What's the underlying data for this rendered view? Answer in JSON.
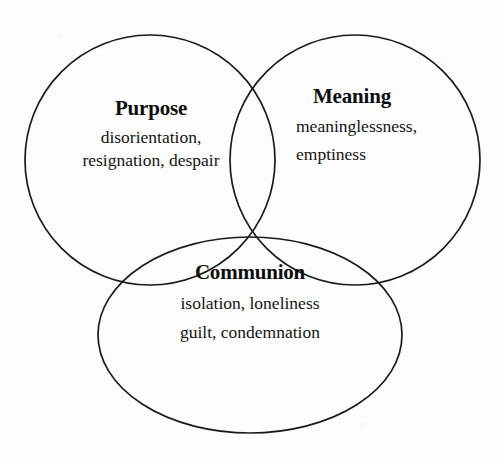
{
  "diagram": {
    "type": "venn",
    "set_count": 3,
    "background_color": "#fdfdfd",
    "stroke_color": "#1a1a1a",
    "text_color": "#111111",
    "sets": [
      {
        "id": "purpose",
        "heading": "Purpose",
        "lines": [
          "disorientation,",
          "resignation, despair"
        ],
        "shape": "circle",
        "center_x": 150,
        "center_y": 160,
        "radius": 125
      },
      {
        "id": "meaning",
        "heading": "Meaning",
        "lines": [
          "meaninglessness,",
          "emptiness"
        ],
        "shape": "circle",
        "center_x": 355,
        "center_y": 160,
        "radius": 125
      },
      {
        "id": "communion",
        "heading": "Communion",
        "lines": [
          "isolation, loneliness",
          "guilt, condemnation"
        ],
        "shape": "ellipse",
        "center_x": 250,
        "center_y": 335,
        "radius_x": 152,
        "radius_y": 98
      }
    ]
  }
}
